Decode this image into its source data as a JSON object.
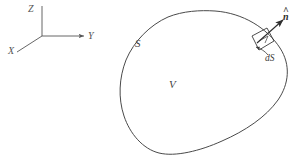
{
  "figure": {
    "background_color": "#ffffff",
    "line_color": "#4a4a4a",
    "axes": {
      "origin": {
        "x": 42,
        "y": 36
      },
      "labels": {
        "z": "Z",
        "y": "Y",
        "x": "X"
      }
    },
    "surface_label": "S",
    "volume_label": "V",
    "patch_label": "dS",
    "normal_label": {
      "symbol": "n",
      "accent": "^"
    }
  }
}
